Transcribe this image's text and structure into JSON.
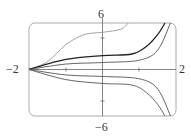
{
  "chart_data": {
    "type": "line",
    "title": "",
    "xlabel": "",
    "ylabel": "",
    "xlim": [
      -2,
      2
    ],
    "ylim": [
      -6,
      6
    ],
    "x_tick_labels": [
      "-2",
      "2"
    ],
    "y_tick_labels": [
      "6",
      "-6"
    ],
    "x_ticks": [
      -1,
      1
    ],
    "y_ticks": [
      -3,
      3
    ],
    "grid": false,
    "series": [
      {
        "name": "curve-1",
        "color": "#999999",
        "points": [
          [
            -2,
            0
          ],
          [
            -1.5,
            1
          ],
          [
            -1,
            3.2
          ],
          [
            -0.5,
            4.5
          ],
          [
            0,
            4.8
          ],
          [
            0.5,
            5.2
          ],
          [
            0.7,
            6
          ]
        ]
      },
      {
        "name": "curve-2",
        "color": "#222222",
        "points": [
          [
            -2,
            0
          ],
          [
            -1,
            1.3
          ],
          [
            0,
            1.8
          ],
          [
            0.8,
            2
          ],
          [
            1.2,
            3
          ],
          [
            1.5,
            4.5
          ],
          [
            1.7,
            6
          ]
        ]
      },
      {
        "name": "curve-3",
        "color": "#555555",
        "points": [
          [
            -2,
            0
          ],
          [
            -1,
            0.7
          ],
          [
            0,
            0.9
          ],
          [
            1,
            1.2
          ],
          [
            1.5,
            2.5
          ],
          [
            1.85,
            6
          ]
        ]
      },
      {
        "name": "curve-4",
        "color": "#555555",
        "points": [
          [
            -2,
            0
          ],
          [
            -1,
            -0.7
          ],
          [
            0,
            -0.9
          ],
          [
            1,
            -1.2
          ],
          [
            1.5,
            -2.5
          ],
          [
            1.85,
            -6
          ]
        ]
      },
      {
        "name": "curve-5",
        "color": "#555555",
        "points": [
          [
            -2,
            0
          ],
          [
            -1,
            -1.3
          ],
          [
            0,
            -1.8
          ],
          [
            0.8,
            -2
          ],
          [
            1.2,
            -3
          ],
          [
            1.5,
            -4.5
          ],
          [
            1.7,
            -6
          ]
        ]
      }
    ]
  },
  "axes": {
    "x_min_label": "−2",
    "x_max_label": "2",
    "y_max_label": "6",
    "y_min_label": "−6"
  }
}
